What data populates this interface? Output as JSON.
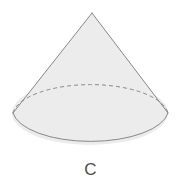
{
  "figure": {
    "type": "geometric-solid",
    "solid_name": "cone",
    "label": "C",
    "background_color": "#ffffff",
    "fill_color": "#ececec",
    "stroke_color": "#888888",
    "hidden_edge_stroke_color": "#8a8a8a",
    "label_color": "#4d4d4d",
    "stroke_width": 1,
    "hidden_edge_dash": "4 3",
    "geometry": {
      "apex_x": 92,
      "apex_y": 13,
      "base_center_x": 90,
      "base_center_y": 113,
      "base_radius_x": 78,
      "base_radius_y": 32,
      "left_tangent_x": 13,
      "left_tangent_y": 113,
      "right_tangent_x": 168,
      "right_tangent_y": 113,
      "base_bottom_y": 145
    }
  }
}
